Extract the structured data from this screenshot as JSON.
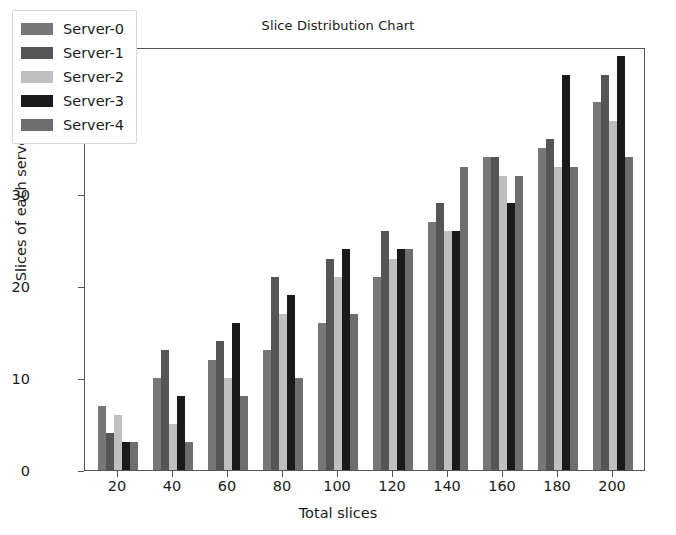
{
  "chart_data": {
    "type": "bar",
    "title": "Slice Distribution Chart",
    "xlabel": "Total slices",
    "ylabel": "Slices of each server",
    "categories": [
      20,
      40,
      60,
      80,
      100,
      120,
      140,
      160,
      180,
      200
    ],
    "xticks": [
      20,
      40,
      60,
      80,
      100,
      120,
      140,
      160,
      180,
      200
    ],
    "yticks": [
      0,
      10,
      20,
      30,
      40
    ],
    "ylim": [
      0,
      46
    ],
    "xlim": [
      8,
      212
    ],
    "grid": false,
    "legend_position": "upper left",
    "series": [
      {
        "name": "Server-0",
        "color": "#777777",
        "values": [
          7,
          10,
          12,
          13,
          16,
          21,
          27,
          34,
          35,
          40
        ]
      },
      {
        "name": "Server-1",
        "color": "#555555",
        "values": [
          4,
          13,
          14,
          21,
          23,
          26,
          29,
          34,
          36,
          43
        ]
      },
      {
        "name": "Server-2",
        "color": "#bfbfbf",
        "values": [
          6,
          5,
          10,
          17,
          21,
          23,
          26,
          32,
          33,
          38
        ]
      },
      {
        "name": "Server-3",
        "color": "#1a1a1a",
        "values": [
          3,
          8,
          16,
          19,
          24,
          24,
          26,
          29,
          43,
          45
        ]
      },
      {
        "name": "Server-4",
        "color": "#6e6e6e",
        "values": [
          3,
          3,
          8,
          10,
          17,
          24,
          33,
          32,
          33,
          34
        ]
      }
    ]
  },
  "legend": {
    "items": [
      {
        "label": "Server-0"
      },
      {
        "label": "Server-1"
      },
      {
        "label": "Server-2"
      },
      {
        "label": "Server-3"
      },
      {
        "label": "Server-4"
      }
    ]
  }
}
